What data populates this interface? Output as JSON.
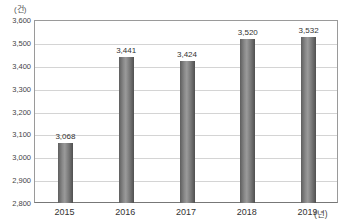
{
  "chart_data": {
    "type": "bar",
    "title": "",
    "xlabel": "(년)",
    "ylabel": "(건)",
    "categories": [
      "2015",
      "2016",
      "2017",
      "2018",
      "2019"
    ],
    "values": [
      3068,
      3441,
      3424,
      3520,
      3532
    ],
    "value_labels": [
      "3,068",
      "3,441",
      "3,424",
      "3,520",
      "3,532"
    ],
    "ylim": [
      2800,
      3600
    ],
    "yticks": [
      2800,
      2900,
      3000,
      3100,
      3200,
      3300,
      3400,
      3500,
      3600
    ],
    "ytick_labels": [
      "2,800",
      "2,900",
      "3,000",
      "3,100",
      "3,200",
      "3,300",
      "3,400",
      "3,500",
      "3,600"
    ],
    "grid": true,
    "legend": null,
    "bar_color": "#7a7a7a"
  },
  "labels": {
    "y_unit": "(건)",
    "x_unit": "(년)"
  }
}
